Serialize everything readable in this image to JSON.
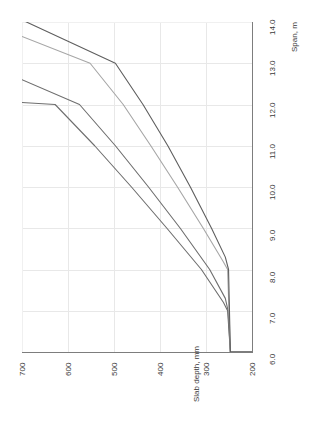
{
  "chart_data": {
    "type": "line",
    "title": "",
    "subtitle": "",
    "orientation": "rotated-90ccw",
    "xlabel": "Span, m",
    "ylabel": "Slab depth, mm",
    "grid": true,
    "legend": "none",
    "x_axis": {
      "name": "Span, m",
      "label": "Span, m",
      "min": 6.0,
      "max": 14.0,
      "tick_step": 1.0,
      "ticks": [
        "6.0",
        "7.0",
        "8.0",
        "9.0",
        "10.0",
        "11.0",
        "12.0",
        "13.0",
        "14.0"
      ],
      "tick_values": [
        6.0,
        7.0,
        8.0,
        9.0,
        10.0,
        11.0,
        12.0,
        13.0,
        14.0
      ]
    },
    "y_axis": {
      "name": "Slab depth, mm",
      "label": "Slab depth, mm",
      "min": 200,
      "max": 700,
      "tick_step": 100,
      "ticks": [
        "200",
        "300",
        "400",
        "500",
        "600",
        "700"
      ],
      "tick_values": [
        200,
        300,
        400,
        500,
        600,
        700
      ],
      "inverted": true
    },
    "series": [
      {
        "name": "curve-1",
        "color": "#6e6e6e",
        "x": [
          6.0,
          6.0,
          7.0,
          7.2,
          8.0,
          9.0,
          10.0,
          11.0,
          12.0,
          12.05
        ],
        "y": [
          200,
          247,
          253,
          262,
          310,
          385,
          462,
          542,
          628,
          700
        ],
        "points": [
          {
            "span": 6.0,
            "depth": 200
          },
          {
            "span": 6.0,
            "depth": 247
          },
          {
            "span": 7.0,
            "depth": 253
          },
          {
            "span": 7.2,
            "depth": 262
          },
          {
            "span": 8.0,
            "depth": 310
          },
          {
            "span": 9.0,
            "depth": 385
          },
          {
            "span": 10.0,
            "depth": 462
          },
          {
            "span": 11.0,
            "depth": 542
          },
          {
            "span": 12.0,
            "depth": 628
          },
          {
            "span": 12.05,
            "depth": 700
          }
        ]
      },
      {
        "name": "curve-2",
        "color": "#6e6e6e",
        "x": [
          6.0,
          6.0,
          7.0,
          7.3,
          8.0,
          9.0,
          10.0,
          11.0,
          12.0,
          12.6
        ],
        "y": [
          200,
          247,
          252,
          258,
          292,
          356,
          425,
          497,
          575,
          700
        ],
        "points": [
          {
            "span": 6.0,
            "depth": 200
          },
          {
            "span": 6.0,
            "depth": 247
          },
          {
            "span": 7.0,
            "depth": 252
          },
          {
            "span": 7.3,
            "depth": 258
          },
          {
            "span": 8.0,
            "depth": 292
          },
          {
            "span": 9.0,
            "depth": 356
          },
          {
            "span": 10.0,
            "depth": 425
          },
          {
            "span": 11.0,
            "depth": 497
          },
          {
            "span": 12.0,
            "depth": 575
          },
          {
            "span": 12.6,
            "depth": 700
          }
        ]
      },
      {
        "name": "curve-3",
        "color": "#a6a6a6",
        "x": [
          6.0,
          6.0,
          7.0,
          8.0,
          8.2,
          9.0,
          10.0,
          11.0,
          12.0,
          13.0,
          13.65
        ],
        "y": [
          200,
          247,
          250,
          253,
          263,
          306,
          362,
          420,
          480,
          552,
          700
        ],
        "points": [
          {
            "span": 6.0,
            "depth": 200
          },
          {
            "span": 6.0,
            "depth": 247
          },
          {
            "span": 7.0,
            "depth": 250
          },
          {
            "span": 8.0,
            "depth": 253
          },
          {
            "span": 8.2,
            "depth": 263
          },
          {
            "span": 9.0,
            "depth": 306
          },
          {
            "span": 10.0,
            "depth": 362
          },
          {
            "span": 11.0,
            "depth": 420
          },
          {
            "span": 12.0,
            "depth": 480
          },
          {
            "span": 13.0,
            "depth": 552
          },
          {
            "span": 13.65,
            "depth": 700
          }
        ]
      },
      {
        "name": "curve-4",
        "color": "#5e5e5e",
        "x": [
          6.0,
          6.0,
          7.0,
          8.0,
          8.3,
          9.0,
          10.0,
          11.0,
          12.0,
          13.0,
          14.05
        ],
        "y": [
          200,
          247,
          249,
          251,
          258,
          288,
          334,
          383,
          437,
          497,
          700
        ],
        "points": [
          {
            "span": 6.0,
            "depth": 200
          },
          {
            "span": 6.0,
            "depth": 247
          },
          {
            "span": 7.0,
            "depth": 249
          },
          {
            "span": 8.0,
            "depth": 251
          },
          {
            "span": 8.3,
            "depth": 258
          },
          {
            "span": 9.0,
            "depth": 288
          },
          {
            "span": 10.0,
            "depth": 334
          },
          {
            "span": 11.0,
            "depth": 383
          },
          {
            "span": 12.0,
            "depth": 437
          },
          {
            "span": 13.0,
            "depth": 497
          },
          {
            "span": 14.05,
            "depth": 700
          }
        ]
      }
    ]
  },
  "labels": {
    "depth_ticks": [
      "700",
      "600",
      "500",
      "400",
      "300",
      "200"
    ],
    "span_ticks": [
      "14.0",
      "13.0",
      "12.0",
      "11.0",
      "10.0",
      "9.0",
      "8.0",
      "7.0",
      "6.0"
    ],
    "depth_axis_title": "Slab depth, mm",
    "span_axis_title": "Span, m"
  },
  "colors": {
    "grid": "#e8e8e8",
    "spine": "#7d7d7d",
    "text": "#3a3a3a",
    "background": "#ffffff"
  }
}
